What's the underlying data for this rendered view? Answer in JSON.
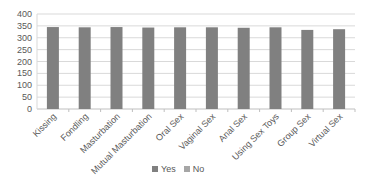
{
  "chart_data": {
    "type": "bar",
    "title": "",
    "xlabel": "",
    "ylabel": "",
    "ylim": [
      0,
      400
    ],
    "yticks": [
      0,
      50,
      100,
      150,
      200,
      250,
      300,
      350,
      400
    ],
    "grid": true,
    "legend_position": "bottom",
    "stacked": true,
    "categories": [
      "Kissing",
      "Fondling",
      "Masturbation",
      "Mutual Masturbation",
      "Oral Sex",
      "Vaginal Sex",
      "Anal Sex",
      "Using Sex Toys",
      "Group Sex",
      "Virtual Sex"
    ],
    "series": [
      {
        "name": "Yes",
        "color": "#808080",
        "values": [
          345,
          344,
          345,
          343,
          344,
          344,
          342,
          344,
          333,
          336
        ]
      },
      {
        "name": "No",
        "color": "#a6a6a6",
        "values": [
          0,
          0,
          0,
          0,
          0,
          0,
          0,
          0,
          0,
          0
        ]
      }
    ]
  },
  "legend": {
    "items": [
      {
        "label": "Yes",
        "color": "#808080"
      },
      {
        "label": "No",
        "color": "#a6a6a6"
      }
    ]
  }
}
